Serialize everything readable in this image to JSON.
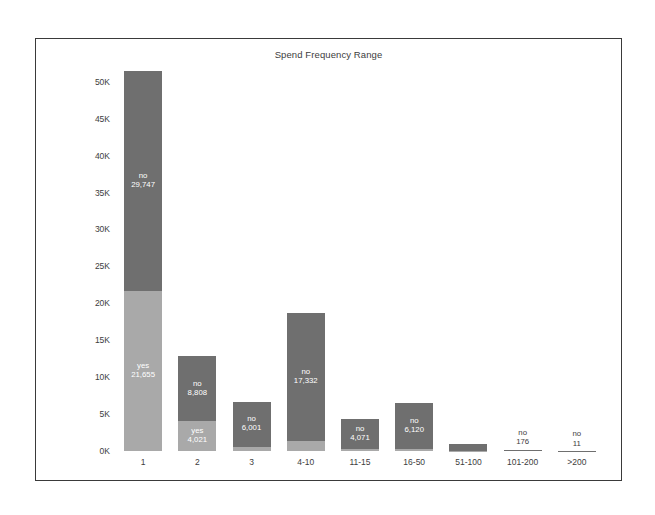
{
  "chart_data": {
    "type": "bar",
    "title": "Spend Frequency Range",
    "xlabel": "",
    "ylabel": "Count of Churner",
    "stacked": true,
    "grid": false,
    "legend": "none",
    "ylim": [
      0,
      52000
    ],
    "y_ticks": [
      "0K",
      "5K",
      "10K",
      "15K",
      "20K",
      "25K",
      "30K",
      "35K",
      "40K",
      "45K",
      "50K"
    ],
    "y_tick_values": [
      0,
      5000,
      10000,
      15000,
      20000,
      25000,
      30000,
      35000,
      40000,
      45000,
      50000
    ],
    "categories": [
      "1",
      "2",
      "3",
      "4-10",
      "11-15",
      "16-50",
      "51-100",
      "101-200",
      ">200"
    ],
    "series": [
      {
        "name": "yes",
        "values": [
          21655,
          4021,
          600,
          1400,
          260,
          330,
          30,
          8,
          1
        ]
      },
      {
        "name": "no",
        "values": [
          29747,
          8808,
          6001,
          17332,
          4071,
          6120,
          900,
          176,
          11
        ]
      }
    ],
    "bar_labels": [
      {
        "category": "1",
        "no_name": "no",
        "no_value": "29,747",
        "yes_name": "yes",
        "yes_value": "21,655"
      },
      {
        "category": "2",
        "no_name": "no",
        "no_value": "8,808",
        "yes_name": "yes",
        "yes_value": "4,021"
      },
      {
        "category": "3",
        "no_name": "no",
        "no_value": "6,001",
        "yes_name": "",
        "yes_value": ""
      },
      {
        "category": "4-10",
        "no_name": "no",
        "no_value": "17,332",
        "yes_name": "",
        "yes_value": ""
      },
      {
        "category": "11-15",
        "no_name": "no",
        "no_value": "4,071",
        "yes_name": "",
        "yes_value": ""
      },
      {
        "category": "16-50",
        "no_name": "no",
        "no_value": "6,120",
        "yes_name": "",
        "yes_value": ""
      },
      {
        "category": "51-100",
        "no_name": "",
        "no_value": "",
        "yes_name": "",
        "yes_value": ""
      },
      {
        "category": "101-200",
        "no_name": "no",
        "no_value": "176",
        "yes_name": "",
        "yes_value": ""
      },
      {
        "category": ">200",
        "no_name": "no",
        "no_value": "11",
        "yes_name": "",
        "yes_value": ""
      }
    ],
    "colors": {
      "no": "#6f6f6f",
      "yes": "#a9a9a9",
      "text": "#3d3d3d",
      "label_on_bar": "#ffffff",
      "frame": "#3a3a3a",
      "background": "#ffffff"
    }
  }
}
